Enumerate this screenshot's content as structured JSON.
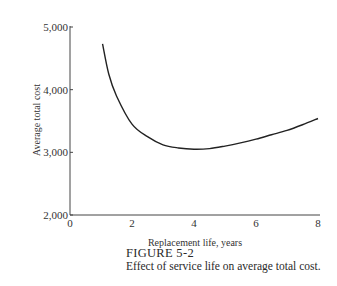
{
  "chart_data": {
    "type": "line",
    "title": "",
    "xlabel": "Replacement life, years",
    "ylabel": "Average total cost",
    "xlim": [
      0,
      8
    ],
    "ylim": [
      2000,
      5000
    ],
    "x_ticks": [
      "0",
      "2",
      "4",
      "6",
      "8"
    ],
    "y_ticks": [
      "2,000",
      "3,000",
      "4,000",
      "5,000"
    ],
    "grid": false,
    "legend": null,
    "series": [
      {
        "name": "Average total cost",
        "x": [
          1.05,
          1.25,
          1.5,
          2.0,
          2.5,
          3.0,
          3.5,
          4.0,
          4.5,
          5.0,
          5.5,
          6.0,
          6.5,
          7.0,
          7.5,
          8.0
        ],
        "values": [
          4730,
          4250,
          3900,
          3450,
          3250,
          3120,
          3070,
          3050,
          3060,
          3100,
          3150,
          3210,
          3280,
          3350,
          3440,
          3540
        ]
      }
    ]
  },
  "caption": {
    "figure_label": "FIGURE 5-2",
    "text": "Effect of service life on average total cost."
  }
}
